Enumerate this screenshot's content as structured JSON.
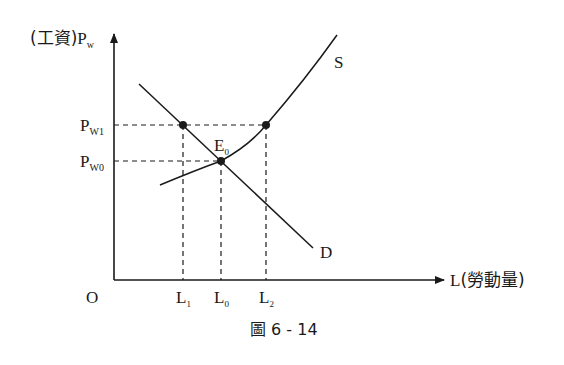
{
  "diagram": {
    "type": "labor-market supply-demand",
    "caption": "圖 6 - 14",
    "origin_label": "O",
    "y_axis": {
      "prefix": "(工資)",
      "symbol": "P",
      "subscript": "w"
    },
    "x_axis": {
      "symbol": "L",
      "suffix": "(勞動量)"
    },
    "curves": [
      {
        "id": "S",
        "label": "S",
        "kind": "supply"
      },
      {
        "id": "D",
        "label": "D",
        "kind": "demand"
      }
    ],
    "price_levels": [
      {
        "symbol": "P",
        "subscript": "W1"
      },
      {
        "symbol": "P",
        "subscript": "W0"
      }
    ],
    "quantity_levels": [
      {
        "symbol": "L",
        "subscript": "1"
      },
      {
        "symbol": "L",
        "subscript": "0"
      },
      {
        "symbol": "L",
        "subscript": "2"
      }
    ],
    "equilibrium": {
      "symbol": "E",
      "subscript": "0"
    }
  },
  "colors": {
    "ink": "#1a1a1a",
    "background": "#ffffff"
  }
}
